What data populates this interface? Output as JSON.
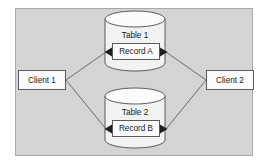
{
  "diagram": {
    "canvas": {
      "width": 269,
      "height": 164
    },
    "panel": {
      "name": "diagram-panel",
      "fill": "#d4d4d4",
      "border": "#a8a8a8",
      "x": 15,
      "y": 8,
      "width": 238,
      "height": 148
    },
    "colors": {
      "page_background": "#ffffff",
      "panel_fill": "#d4d4d4",
      "shape_fill": "#f2f2f2",
      "shape_stroke": "#5a5a5a",
      "connector_stroke": "#6b6b6b",
      "text": "#1a1a1a"
    },
    "nodes": [
      {
        "id": "client1",
        "type": "box",
        "label": "Client 1",
        "x": 18,
        "y": 70,
        "width": 48,
        "height": 20
      },
      {
        "id": "client2",
        "type": "box",
        "label": "Client 2",
        "x": 206,
        "y": 70,
        "width": 48,
        "height": 20
      },
      {
        "id": "table1",
        "type": "cylinder",
        "label": "Table 1",
        "x": 105,
        "y": 11,
        "width": 60,
        "height": 60,
        "record": {
          "id": "recordA",
          "type": "box",
          "label": "Record A",
          "x": 112,
          "y": 43,
          "width": 48,
          "height": 17
        }
      },
      {
        "id": "table2",
        "type": "cylinder",
        "label": "Table 2",
        "x": 105,
        "y": 88,
        "width": 60,
        "height": 60,
        "record": {
          "id": "recordB",
          "type": "box",
          "label": "Record B",
          "x": 112,
          "y": 120,
          "width": 48,
          "height": 17
        }
      }
    ],
    "connectors": [
      {
        "id": "client1-to-recordA",
        "from": "client1",
        "to": "recordA",
        "arrow": "to"
      },
      {
        "id": "client1-to-recordB",
        "from": "client1",
        "to": "recordB",
        "arrow": "to"
      },
      {
        "id": "client2-to-recordA",
        "from": "client2",
        "to": "recordA",
        "arrow": "to"
      },
      {
        "id": "client2-to-recordB",
        "from": "client2",
        "to": "recordB",
        "arrow": "to"
      }
    ]
  }
}
